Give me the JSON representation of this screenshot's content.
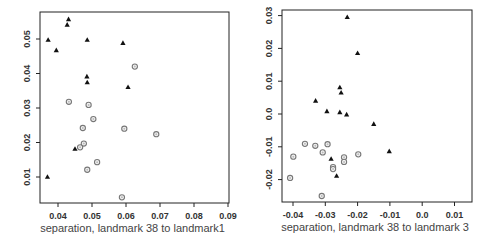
{
  "chart_data": [
    {
      "type": "scatter",
      "title": "",
      "xlabel": "separation, landmark 38 to landmark1",
      "ylabel": "",
      "xlim": [
        0.035,
        0.091
      ],
      "ylim": [
        0.002,
        0.058
      ],
      "xticks": [
        0.04,
        0.05,
        0.06,
        0.07,
        0.08,
        0.09
      ],
      "xtick_labels": [
        "0.04",
        "0.05",
        "0.06",
        "0.07",
        "0.08",
        "0.09"
      ],
      "yticks": [
        0.01,
        0.02,
        0.03,
        0.04,
        0.05
      ],
      "ytick_labels": [
        "0.01",
        "0.02",
        "0.03",
        "0.04",
        "0.05"
      ],
      "grid": false,
      "legend": null,
      "frame": {
        "left": 40,
        "top": 12,
        "right": 229,
        "bottom": 203
      },
      "px": {
        "x0_val": 0.04,
        "x0_px": 58,
        "x_px_per_unit": 3400,
        "y0_val": 0.05,
        "y0_px": 39,
        "y_px_per_unit": 3450
      },
      "series": [
        {
          "name": "triangles",
          "marker": "triangle-filled",
          "color": "#111111",
          "points": [
            [
              0.0431,
              0.0557
            ],
            [
              0.0427,
              0.0541
            ],
            [
              0.0371,
              0.0497
            ],
            [
              0.0486,
              0.0497
            ],
            [
              0.0591,
              0.0488
            ],
            [
              0.0395,
              0.0467
            ],
            [
              0.0485,
              0.0391
            ],
            [
              0.0486,
              0.0374
            ],
            [
              0.0606,
              0.036
            ],
            [
              0.045,
              0.0181
            ],
            [
              0.0369,
              0.01
            ]
          ]
        },
        {
          "name": "circles",
          "marker": "circle-open",
          "color": "#777777",
          "points": [
            [
              0.0626,
              0.042
            ],
            [
              0.0432,
              0.0318
            ],
            [
              0.049,
              0.0309
            ],
            [
              0.0504,
              0.0268
            ],
            [
              0.0473,
              0.0242
            ],
            [
              0.0595,
              0.024
            ],
            [
              0.0689,
              0.0224
            ],
            [
              0.0476,
              0.0197
            ],
            [
              0.0465,
              0.0186
            ],
            [
              0.0515,
              0.0143
            ],
            [
              0.0486,
              0.0121
            ],
            [
              0.0588,
              0.0041
            ]
          ]
        }
      ]
    },
    {
      "type": "scatter",
      "title": "",
      "xlabel": "separation, landmark 38 to landmark 3",
      "ylabel": "",
      "xlim": [
        -0.0435,
        0.0155
      ],
      "ylim": [
        -0.027,
        0.031
      ],
      "xticks": [
        -0.04,
        -0.03,
        -0.02,
        -0.01,
        0.0,
        0.01
      ],
      "xtick_labels": [
        "-0.04",
        "-0.03",
        "-0.02",
        "-0.01",
        "0.0",
        "0.01"
      ],
      "yticks": [
        -0.02,
        -0.01,
        0.0,
        0.01,
        0.02,
        0.03
      ],
      "ytick_labels": [
        "-0.02",
        "-0.01",
        "0.0",
        "0.01",
        "0.02",
        "0.03"
      ],
      "grid": false,
      "legend": null,
      "frame": {
        "left": 282,
        "top": 10,
        "right": 472,
        "bottom": 202
      },
      "px": {
        "x0_val": -0.04,
        "x0_px": 293,
        "x_px_per_unit": 3230,
        "y0_val": 0.0,
        "y0_px": 114,
        "y_px_per_unit": 3280
      },
      "series": [
        {
          "name": "triangles",
          "marker": "triangle-filled",
          "color": "#111111",
          "points": [
            [
              -0.0232,
              0.0295
            ],
            [
              -0.02,
              0.0185
            ],
            [
              -0.0255,
              0.0081
            ],
            [
              -0.0251,
              0.0065
            ],
            [
              -0.033,
              0.004
            ],
            [
              -0.0295,
              0.0008
            ],
            [
              -0.0255,
              0.0005
            ],
            [
              -0.0234,
              -0.0002
            ],
            [
              -0.015,
              -0.0031
            ],
            [
              -0.0102,
              -0.0114
            ],
            [
              -0.0282,
              -0.0137
            ],
            [
              -0.0265,
              -0.0189
            ]
          ]
        },
        {
          "name": "circles",
          "marker": "circle-open",
          "color": "#777777",
          "points": [
            [
              -0.0363,
              -0.0091
            ],
            [
              -0.0331,
              -0.0097
            ],
            [
              -0.0293,
              -0.0092
            ],
            [
              -0.0308,
              -0.0117
            ],
            [
              -0.0399,
              -0.013
            ],
            [
              -0.0198,
              -0.0123
            ],
            [
              -0.0242,
              -0.0132
            ],
            [
              -0.0242,
              -0.0146
            ],
            [
              -0.0276,
              -0.0162
            ],
            [
              -0.0276,
              -0.0168
            ],
            [
              -0.0409,
              -0.0195
            ],
            [
              -0.0311,
              -0.025
            ]
          ]
        }
      ]
    }
  ]
}
